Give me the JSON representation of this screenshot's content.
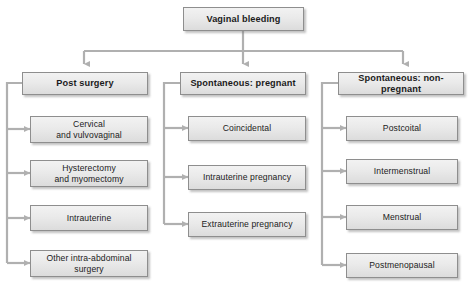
{
  "diagram": {
    "title": "Vaginal bleeding",
    "root": {
      "label": "Vaginal bleeding"
    },
    "columns": [
      {
        "header": "Post surgery",
        "items": [
          {
            "label": "Cervical\nand vulvovaginal"
          },
          {
            "label": "Hysterectomy\nand myomectomy"
          },
          {
            "label": "Intrauterine"
          },
          {
            "label": "Other intra-abdominal\nsurgery"
          }
        ]
      },
      {
        "header": "Spontaneous: pregnant",
        "items": [
          {
            "label": "Coincidental"
          },
          {
            "label": "Intrauterine pregnancy"
          },
          {
            "label": "Extrauterine pregnancy"
          }
        ]
      },
      {
        "header": "Spontaneous: non-pregnant",
        "items": [
          {
            "label": "Postcoital"
          },
          {
            "label": "Intermenstrual"
          },
          {
            "label": "Menstrual"
          },
          {
            "label": "Postmenopausal"
          }
        ]
      }
    ],
    "colors": {
      "box_fill_top": "#f2f2f2",
      "box_fill_bottom": "#dcdcdc",
      "box_border": "#8e8e8e",
      "connector": "#b0b0b0",
      "text": "#1b1b1b",
      "background": "#ffffff"
    }
  }
}
